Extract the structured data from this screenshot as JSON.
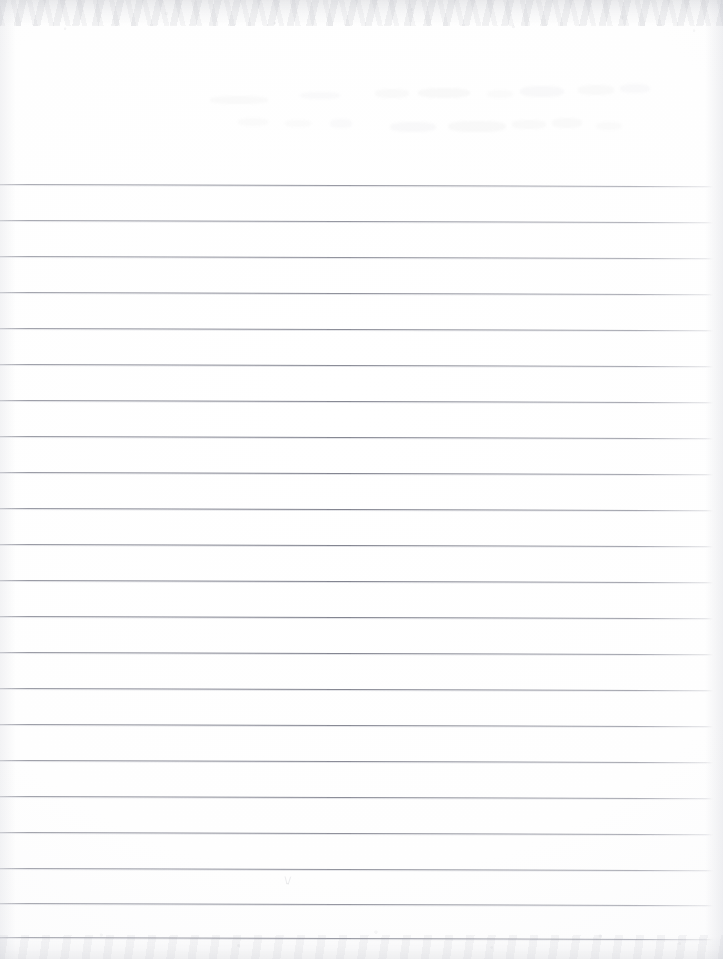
{
  "document": {
    "kind": "scanned-lined-paper",
    "title": "Blank ruled notebook page",
    "page_width": 723,
    "page_height": 959,
    "content_text": "",
    "is_blank": "true"
  },
  "paper": {
    "background_color": "#fefefe",
    "tint_color": "#f7f7f9",
    "rule_color": "#7c7e87",
    "rule_halo_color": "#b8bac4",
    "edge_shadow_color": "#c4c6ce",
    "scan_edge_color": "#aaacb4"
  },
  "header": {
    "label": "unruled header area",
    "top": 0,
    "height": 184,
    "ghost_marks": [
      {
        "left": 210,
        "top": 96,
        "width": 58,
        "height": 8,
        "opacity": 0.05
      },
      {
        "left": 300,
        "top": 92,
        "width": 40,
        "height": 7,
        "opacity": 0.045
      },
      {
        "left": 375,
        "top": 89,
        "width": 34,
        "height": 9,
        "opacity": 0.05
      },
      {
        "left": 418,
        "top": 88,
        "width": 52,
        "height": 10,
        "opacity": 0.06
      },
      {
        "left": 487,
        "top": 90,
        "width": 26,
        "height": 8,
        "opacity": 0.04
      },
      {
        "left": 520,
        "top": 86,
        "width": 44,
        "height": 11,
        "opacity": 0.055
      },
      {
        "left": 578,
        "top": 85,
        "width": 36,
        "height": 10,
        "opacity": 0.05
      },
      {
        "left": 620,
        "top": 84,
        "width": 30,
        "height": 9,
        "opacity": 0.045
      },
      {
        "left": 238,
        "top": 118,
        "width": 30,
        "height": 8,
        "opacity": 0.04
      },
      {
        "left": 285,
        "top": 120,
        "width": 26,
        "height": 7,
        "opacity": 0.04
      },
      {
        "left": 330,
        "top": 119,
        "width": 22,
        "height": 9,
        "opacity": 0.045
      },
      {
        "left": 390,
        "top": 122,
        "width": 46,
        "height": 10,
        "opacity": 0.055
      },
      {
        "left": 448,
        "top": 121,
        "width": 58,
        "height": 11,
        "opacity": 0.06
      },
      {
        "left": 512,
        "top": 120,
        "width": 34,
        "height": 9,
        "opacity": 0.05
      },
      {
        "left": 552,
        "top": 118,
        "width": 30,
        "height": 10,
        "opacity": 0.05
      },
      {
        "left": 596,
        "top": 122,
        "width": 26,
        "height": 8,
        "opacity": 0.04
      }
    ]
  },
  "ruling": {
    "label": "ruled writing lines",
    "line_count": 22,
    "first_line_y": 184,
    "line_pitch": 36.0,
    "line_left": 0,
    "line_right": 713,
    "slope_degrees": 0.18,
    "lines_y": [
      184,
      220,
      256,
      292,
      328,
      364,
      400,
      436,
      472,
      508,
      544,
      580,
      616,
      652,
      688,
      724,
      760,
      796,
      832,
      868,
      903,
      937
    ]
  },
  "annotations": {
    "pencil_tick": {
      "label": "faint pencil tick",
      "left": 284,
      "top": 876,
      "width": 8,
      "height": 11
    }
  }
}
